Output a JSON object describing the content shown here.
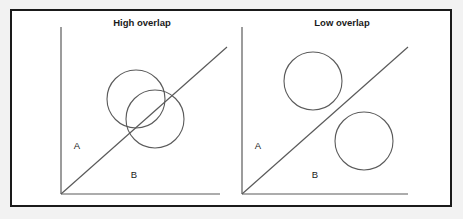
{
  "figure": {
    "background_color": "#f2f2f2",
    "panel_background_color": "#ffffff",
    "border_color": "#1a1a1a",
    "stroke_color": "#5a5a5a"
  },
  "panels": [
    {
      "id": "high-overlap",
      "title": "High overlap",
      "title_x": 140,
      "title_y": 24,
      "axes": {
        "origin_x": 59,
        "origin_y": 192,
        "y_top": 25,
        "x_right": 218
      },
      "diagonal": {
        "x1": 59,
        "y1": 192,
        "x2": 225,
        "y2": 45
      },
      "region_labels": [
        {
          "text": "A",
          "x": 75,
          "y": 147
        },
        {
          "text": "B",
          "x": 132,
          "y": 176
        }
      ],
      "circles": [
        {
          "cx": 134,
          "cy": 97,
          "r": 29
        },
        {
          "cx": 153,
          "cy": 117,
          "r": 29
        }
      ]
    },
    {
      "id": "low-overlap",
      "title": "Low overlap",
      "title_x": 340,
      "title_y": 24,
      "axes": {
        "origin_x": 240,
        "origin_y": 192,
        "y_top": 25,
        "x_right": 406
      },
      "diagonal": {
        "x1": 240,
        "y1": 192,
        "x2": 406,
        "y2": 45
      },
      "region_labels": [
        {
          "text": "A",
          "x": 256,
          "y": 147
        },
        {
          "text": "B",
          "x": 313,
          "y": 176
        }
      ],
      "circles": [
        {
          "cx": 311,
          "cy": 79,
          "r": 29
        },
        {
          "cx": 362,
          "cy": 139,
          "r": 29
        }
      ]
    }
  ]
}
